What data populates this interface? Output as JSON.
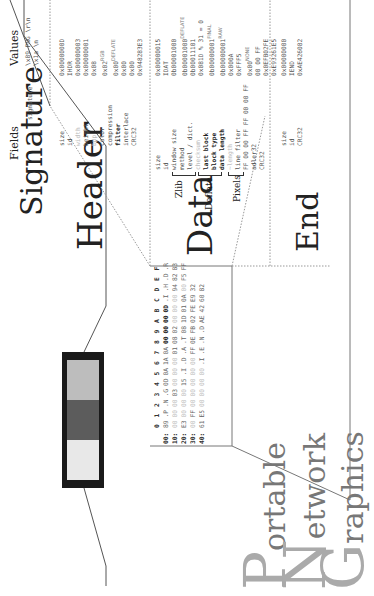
{
  "title": {
    "lines": [
      {
        "initial": "P",
        "rest": "ortable"
      },
      {
        "initial": "N",
        "rest": "etwork"
      },
      {
        "initial": "G",
        "rest": "raphics"
      }
    ]
  },
  "hexdump": {
    "columns": [
      "0",
      "1",
      "2",
      "3",
      "4",
      "5",
      "6",
      "7",
      "8",
      "9",
      "A",
      "B",
      "C",
      "D",
      "E",
      "F"
    ],
    "rows": [
      {
        "offset": "00:",
        "bytes": [
          "89",
          ".P",
          ".N",
          ".G",
          "0D",
          "0A",
          "1A",
          "0A",
          "00",
          "00",
          "00",
          "0D",
          ".I",
          ".H",
          ".D",
          ".R"
        ]
      },
      {
        "offset": "10:",
        "bytes": [
          "00",
          "00",
          "00",
          "03",
          "00",
          "00",
          "00",
          "01",
          "08",
          "02",
          "00",
          "00",
          "00",
          "94",
          "82",
          "83"
        ]
      },
      {
        "offset": "20:",
        "bytes": [
          "E3",
          "00",
          "00",
          "00",
          "15",
          ".I",
          ".D",
          ".A",
          ".T",
          "08",
          "1D",
          "01",
          "0A",
          "00",
          "F5",
          "FF"
        ]
      },
      {
        "offset": "30:",
        "bytes": [
          "00",
          "FF",
          "00",
          "00",
          "00",
          "00",
          "00",
          "FF",
          "0E",
          "FB",
          "02",
          "FE",
          "E9",
          "32",
          "",
          ""
        ]
      },
      {
        "offset": "40:",
        "bytes": [
          "61",
          "E5",
          "00",
          "00",
          "00",
          "00",
          ".I",
          ".E",
          ".N",
          ".D",
          "AE",
          "42",
          "60",
          "82",
          "",
          ""
        ]
      }
    ]
  },
  "preview": {
    "pixel_colors": [
      "#e8e8e8",
      "#5c5c5c",
      "#bdbdbd"
    ],
    "border_color": "#1a1a1a"
  },
  "columns": {
    "fields": "Fields",
    "values": "Values"
  },
  "sections": [
    {
      "label": "Signature",
      "fields": [
        {
          "name": "signature",
          "value": "\\x89 PNG \\r\\n \\x1a \\n"
        }
      ]
    },
    {
      "label": "Header",
      "fields": [
        {
          "name": "size",
          "value": "0x0000000D"
        },
        {
          "name": "id",
          "value": "IHDR"
        },
        {
          "name": "width",
          "value": "0x00000003"
        },
        {
          "name": "height",
          "value": "0x00000001"
        },
        {
          "name": "bpp",
          "value": "0x08"
        },
        {
          "name": "color",
          "value": "0x02",
          "tag": "RGB"
        },
        {
          "name": "compression",
          "value": "0x00",
          "tag": "DEFLATE"
        },
        {
          "name": "filter",
          "value": "0x00"
        },
        {
          "name": "interlace",
          "value": "0x00"
        },
        {
          "name": "CRC32",
          "value": "0x948283E3"
        }
      ]
    },
    {
      "label": "Data",
      "sublabels": {
        "zlib": "Zlib",
        "deflate": "Deflate",
        "pixels": "Pixels"
      },
      "fields": [
        {
          "name": "size",
          "value": "0x00000015"
        },
        {
          "name": "id",
          "value": "IDAT"
        },
        {
          "name": "window size",
          "value": "0b00001000"
        },
        {
          "name": "method",
          "value": "0b00001000",
          "tag": "DEFLATE"
        },
        {
          "name": "level / dict.",
          "value": "0b00011101"
        },
        {
          "name": "checksum",
          "value": "0x081D % 31 = 0"
        },
        {
          "name": "last block",
          "value": "0b00000001",
          "tag": "FINAL"
        },
        {
          "name": "block type",
          "value": "0b00000001",
          "tag": "RAW"
        },
        {
          "name": "data length",
          "value": "0x000A"
        },
        {
          "name": "~length",
          "value": "0xFFF5"
        },
        {
          "name": "line filter",
          "value": "0x00",
          "tag": "NONE"
        },
        {
          "name": "FF 00 00 FF FF 00 00 FF",
          "value": "00 00 FF"
        },
        {
          "name": "adler32",
          "value": "0x0EFB02FE"
        },
        {
          "name": "CRC32",
          "value": "0xE93261E5"
        }
      ]
    },
    {
      "label": "End",
      "fields": [
        {
          "name": "size",
          "value": "0x00000000"
        },
        {
          "name": "id",
          "value": "IEND"
        },
        {
          "name": "CRC32",
          "value": "0xAE426082"
        }
      ]
    }
  ]
}
